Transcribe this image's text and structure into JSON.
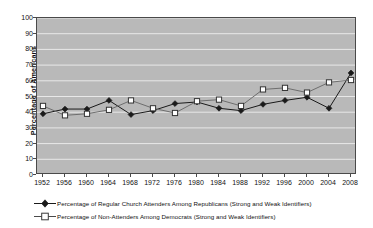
{
  "chart_data": {
    "type": "line",
    "title": "",
    "xlabel": "",
    "ylabel": "Percentage of Americans",
    "ylim": [
      0,
      100
    ],
    "ytick_step": 10,
    "yticks": [
      "100",
      "90",
      "80",
      "70",
      "60",
      "50",
      "40",
      "30",
      "20",
      "10",
      "0"
    ],
    "grid": true,
    "legend_position": "below",
    "categories": [
      "1952",
      "1956",
      "1960",
      "1964",
      "1968",
      "1972",
      "1976",
      "1980",
      "1984",
      "1988",
      "1992",
      "1996",
      "2000",
      "2004",
      "2008"
    ],
    "series": [
      {
        "name": "Percentage of Regular Church Attenders Among Republicans (Strong and Weak Identifiers)",
        "marker": "filled-diamond",
        "color": "#1a1a1a",
        "values": [
          39,
          42,
          42,
          47.5,
          38.5,
          41,
          45.5,
          46.5,
          42.5,
          41,
          45,
          47.5,
          49.5,
          42.5,
          65
        ]
      },
      {
        "name": "Percentage of Non-Attenders Among Democrats (Strong and Weak Identifiers)",
        "marker": "open-square",
        "color": "#6e6e6e",
        "values": [
          44,
          38,
          39,
          41.5,
          47.5,
          42.5,
          39.5,
          47,
          48,
          44,
          54.5,
          55.5,
          52.5,
          59,
          60.5
        ]
      }
    ]
  },
  "axis": {
    "y_title": "Percentage of Americans"
  },
  "legend": {
    "items": [
      {
        "symbol": "filled-diamond-line",
        "label": "Percentage of Regular Church Attenders Among Republicans (Strong and Weak Identifiers)"
      },
      {
        "symbol": "open-square-line",
        "label": "Percentage of Non-Attenders Among Democrats (Strong and Weak Identifiers)"
      }
    ]
  },
  "colors": {
    "plot_background": "#b9b9b9",
    "gridline": "#e8e8e8",
    "axis": "#4a4a4a",
    "series_1": "#1a1a1a",
    "series_2": "#6e6e6e"
  }
}
